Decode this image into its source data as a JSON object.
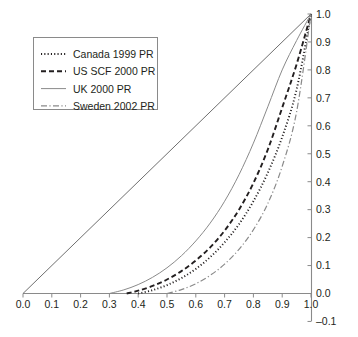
{
  "chart_data": {
    "type": "line",
    "title": "",
    "subtitle": "",
    "xlabel": "",
    "ylabel": "",
    "xlim": [
      0.0,
      1.0
    ],
    "ylim": [
      -0.1,
      1.0
    ],
    "grid": false,
    "legend_position": "top-left",
    "x_ticks": [
      "0.0",
      "0.1",
      "0.2",
      "0.3",
      "0.4",
      "0.5",
      "0.6",
      "0.7",
      "0.8",
      "0.9",
      "1.0"
    ],
    "x_tick_values": [
      0.0,
      0.1,
      0.2,
      0.3,
      0.4,
      0.5,
      0.6,
      0.7,
      0.8,
      0.9,
      1.0
    ],
    "y_ticks": [
      "-0.1",
      "0.0",
      "0.1",
      "0.2",
      "0.3",
      "0.4",
      "0.5",
      "0.6",
      "0.7",
      "0.8",
      "0.9",
      "1.0"
    ],
    "y_tick_values": [
      -0.1,
      0.0,
      0.1,
      0.2,
      0.3,
      0.4,
      0.5,
      0.6,
      0.7,
      0.8,
      0.9,
      1.0
    ],
    "y_axis_side": "right",
    "reference_line": {
      "name": "equality-diagonal",
      "style": "solid",
      "color": "#6f6f6f",
      "x": [
        0.0,
        1.0
      ],
      "y": [
        0.0,
        1.0
      ]
    },
    "series": [
      {
        "name": "Canada 1999 PR",
        "style": "dotted",
        "color": "#231f20",
        "x": [
          0.4,
          0.45,
          0.5,
          0.55,
          0.6,
          0.65,
          0.7,
          0.75,
          0.8,
          0.85,
          0.9,
          0.95,
          1.0
        ],
        "y": [
          0.0,
          0.012,
          0.03,
          0.055,
          0.088,
          0.13,
          0.183,
          0.248,
          0.33,
          0.432,
          0.56,
          0.73,
          1.0
        ]
      },
      {
        "name": "US SCF 2000 PR",
        "style": "dashed",
        "color": "#231f20",
        "x": [
          0.36,
          0.4,
          0.45,
          0.5,
          0.55,
          0.6,
          0.65,
          0.7,
          0.75,
          0.8,
          0.85,
          0.9,
          0.95,
          1.0
        ],
        "y": [
          0.0,
          0.01,
          0.027,
          0.05,
          0.08,
          0.118,
          0.165,
          0.225,
          0.3,
          0.395,
          0.515,
          0.665,
          0.82,
          1.0
        ]
      },
      {
        "name": "UK 2000 PR",
        "style": "solid",
        "color": "#8a8a8a",
        "x": [
          0.3,
          0.35,
          0.4,
          0.45,
          0.5,
          0.55,
          0.6,
          0.65,
          0.7,
          0.75,
          0.8,
          0.85,
          0.9,
          0.95,
          1.0
        ],
        "y": [
          0.0,
          0.013,
          0.032,
          0.058,
          0.092,
          0.135,
          0.188,
          0.252,
          0.33,
          0.425,
          0.538,
          0.668,
          0.8,
          0.905,
          1.0
        ]
      },
      {
        "name": "Sweden 2002 PR",
        "style": "dashdot",
        "color": "#8a8a8a",
        "x": [
          0.5,
          0.55,
          0.6,
          0.65,
          0.7,
          0.75,
          0.8,
          0.85,
          0.9,
          0.95,
          1.0
        ],
        "y": [
          0.0,
          0.014,
          0.035,
          0.065,
          0.105,
          0.158,
          0.228,
          0.322,
          0.455,
          0.65,
          1.0
        ]
      }
    ]
  },
  "legend": {
    "items": [
      {
        "label": "Canada 1999 PR",
        "swatch": "dotted-line-swatch"
      },
      {
        "label": "US SCF 2000 PR",
        "swatch": "dashed-line-swatch"
      },
      {
        "label": "UK 2000 PR",
        "swatch": "solid-line-swatch"
      },
      {
        "label": "Sweden 2002 PR",
        "swatch": "dashdot-line-swatch"
      }
    ]
  },
  "colors": {
    "axis": "#8a8a8a",
    "text": "#231f20",
    "dark_series": "#231f20",
    "light_series": "#8a8a8a",
    "background": "#ffffff"
  }
}
